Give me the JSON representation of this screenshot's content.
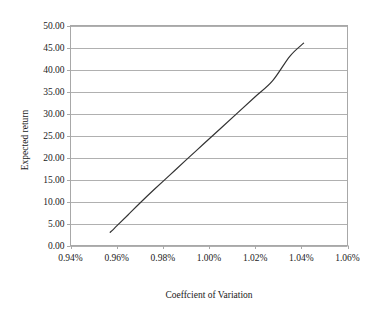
{
  "chart_data": {
    "type": "line",
    "title": "",
    "xlabel": "Coeffcient of Variation",
    "ylabel": "Expected return",
    "xlim": [
      0.0094,
      0.0106
    ],
    "ylim": [
      0,
      50
    ],
    "grid": "horizontal",
    "legend": "none",
    "x_tick_labels": [
      "0.94%",
      "0.96%",
      "0.98%",
      "1.00%",
      "1.02%",
      "1.04%",
      "1.06%"
    ],
    "x_tick_values": [
      0.0094,
      0.0096,
      0.0098,
      0.01,
      0.0102,
      0.0104,
      0.0106
    ],
    "y_tick_labels": [
      "0.00",
      "5.00",
      "10.00",
      "15.00",
      "20.00",
      "25.00",
      "30.00",
      "35.00",
      "40.00",
      "45.00",
      "50.00"
    ],
    "y_tick_values": [
      0,
      5,
      10,
      15,
      20,
      25,
      30,
      35,
      40,
      45,
      50
    ],
    "series": [
      {
        "name": "Efficient frontier",
        "color": "#333333",
        "x": [
          0.009572,
          0.00959,
          0.009615,
          0.00965,
          0.0097,
          0.00976,
          0.00983,
          0.0099,
          0.009975,
          0.01005,
          0.010125,
          0.0102,
          0.010275,
          0.01035,
          0.01041
        ],
        "y": [
          3.0,
          3.9,
          5.2,
          7.0,
          9.6,
          12.6,
          16.0,
          19.4,
          23.0,
          26.6,
          30.2,
          33.8,
          37.4,
          43.0,
          46.0
        ]
      }
    ]
  },
  "axes": {
    "x_title": "Coeffcient of Variation",
    "y_title": "Expected return"
  },
  "style": {
    "line_color": "#333333",
    "grid_color": "#b0b0b0",
    "frame_color": "#a8a8a8",
    "background": "#ffffff",
    "text_color": "#1a1a1a"
  }
}
